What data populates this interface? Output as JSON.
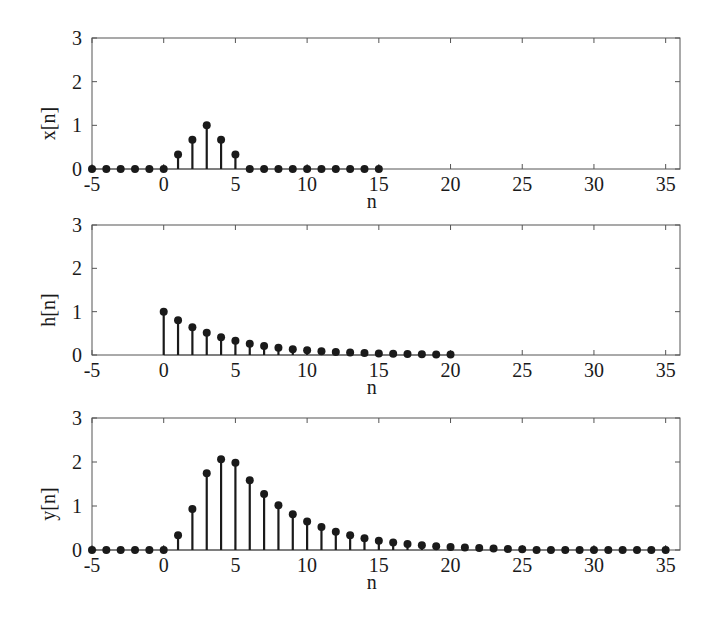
{
  "figure": {
    "panels": [
      {
        "id": "x",
        "ylabel": "x[n]",
        "xlabel": "n"
      },
      {
        "id": "h",
        "ylabel": "h[n]",
        "xlabel": "n"
      },
      {
        "id": "y",
        "ylabel": "y[n]",
        "xlabel": "n"
      }
    ]
  },
  "chart_data": [
    {
      "type": "stem",
      "title": "",
      "xlabel": "n",
      "ylabel": "x[n]",
      "xlim": [
        -5,
        36
      ],
      "ylim": [
        0,
        3
      ],
      "xticks": [
        -5,
        0,
        5,
        10,
        15,
        20,
        25,
        30,
        35
      ],
      "yticks": [
        0,
        1,
        2,
        3
      ],
      "grid": false,
      "x": [
        -5,
        -4,
        -3,
        -2,
        -1,
        0,
        1,
        2,
        3,
        4,
        5,
        6,
        7,
        8,
        9,
        10,
        11,
        12,
        13,
        14,
        15
      ],
      "values": [
        0,
        0,
        0,
        0,
        0,
        0,
        0.333,
        0.667,
        1,
        0.667,
        0.333,
        0,
        0,
        0,
        0,
        0,
        0,
        0,
        0,
        0,
        0
      ]
    },
    {
      "type": "stem",
      "title": "",
      "xlabel": "n",
      "ylabel": "h[n]",
      "xlim": [
        -5,
        36
      ],
      "ylim": [
        0,
        3
      ],
      "xticks": [
        -5,
        0,
        5,
        10,
        15,
        20,
        25,
        30,
        35
      ],
      "yticks": [
        0,
        1,
        2,
        3
      ],
      "grid": false,
      "x": [
        0,
        1,
        2,
        3,
        4,
        5,
        6,
        7,
        8,
        9,
        10,
        11,
        12,
        13,
        14,
        15,
        16,
        17,
        18,
        19,
        20
      ],
      "values": [
        1,
        0.8,
        0.64,
        0.512,
        0.41,
        0.328,
        0.262,
        0.21,
        0.168,
        0.134,
        0.107,
        0.086,
        0.069,
        0.055,
        0.044,
        0.035,
        0.028,
        0.023,
        0.018,
        0.014,
        0.012
      ]
    },
    {
      "type": "stem",
      "title": "",
      "xlabel": "n",
      "ylabel": "y[n]",
      "xlim": [
        -5,
        36
      ],
      "ylim": [
        0,
        3
      ],
      "xticks": [
        -5,
        0,
        5,
        10,
        15,
        20,
        25,
        30,
        35
      ],
      "yticks": [
        0,
        1,
        2,
        3
      ],
      "grid": false,
      "x": [
        -5,
        -4,
        -3,
        -2,
        -1,
        0,
        1,
        2,
        3,
        4,
        5,
        6,
        7,
        8,
        9,
        10,
        11,
        12,
        13,
        14,
        15,
        16,
        17,
        18,
        19,
        20,
        21,
        22,
        23,
        24,
        25,
        26,
        27,
        28,
        29,
        30,
        31,
        32,
        33,
        34,
        35
      ],
      "values": [
        0,
        0,
        0,
        0,
        0,
        0,
        0.333,
        0.933,
        1.747,
        2.064,
        1.984,
        1.587,
        1.27,
        1.016,
        0.813,
        0.65,
        0.52,
        0.416,
        0.333,
        0.266,
        0.213,
        0.17,
        0.136,
        0.109,
        0.087,
        0.07,
        0.055,
        0.043,
        0.032,
        0.023,
        0.015,
        0,
        0,
        0,
        0,
        0,
        0,
        0,
        0,
        0,
        0
      ]
    }
  ]
}
